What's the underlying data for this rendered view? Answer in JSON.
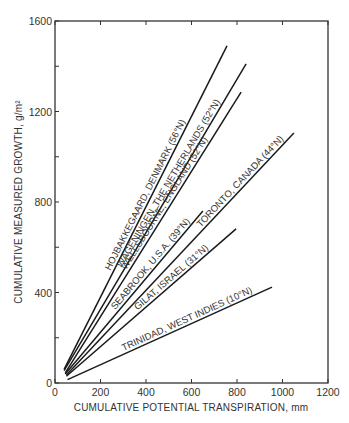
{
  "chart_data": {
    "type": "line",
    "title": "",
    "xlabel": "CUMULATIVE POTENTIAL TRANSPIRATION, mm",
    "ylabel": "CUMULATIVE MEASURED GROWTH, g/m²",
    "xlim": [
      0,
      1200
    ],
    "ylim": [
      0,
      1600
    ],
    "x_ticks": [
      "0",
      "200",
      "400",
      "600",
      "800",
      "1000",
      "1200"
    ],
    "y_ticks": [
      "0",
      "400",
      "800",
      "1200",
      "1600"
    ],
    "grid": false,
    "legend": "inline labels along lines",
    "series": [
      {
        "name": "HOJBAKKEGAARD, DENMARK (56°N)",
        "x": [
          40,
          756
        ],
        "y": [
          60,
          1490
        ]
      },
      {
        "name": "WAGENINGEN, THE NETHERLANDS (52°N)",
        "x": [
          40,
          840
        ],
        "y": [
          55,
          1410
        ]
      },
      {
        "name": "WELLSBOURNE, ENGLAND (52°N)",
        "x": [
          45,
          818
        ],
        "y": [
          45,
          1286
        ]
      },
      {
        "name": "TORONTO, CANADA (44°N)",
        "x": [
          50,
          1050
        ],
        "y": [
          35,
          1105
        ]
      },
      {
        "name": "SEABROOK, U.S.A. (39°N)",
        "x": [
          45,
          650
        ],
        "y": [
          40,
          760
        ]
      },
      {
        "name": "GILAT, ISRAEL (31°N)",
        "x": [
          50,
          796
        ],
        "y": [
          30,
          681
        ]
      },
      {
        "name": "TRINIDAD, WEST INDIES (10°N)",
        "x": [
          55,
          954
        ],
        "y": [
          15,
          424
        ]
      }
    ]
  }
}
